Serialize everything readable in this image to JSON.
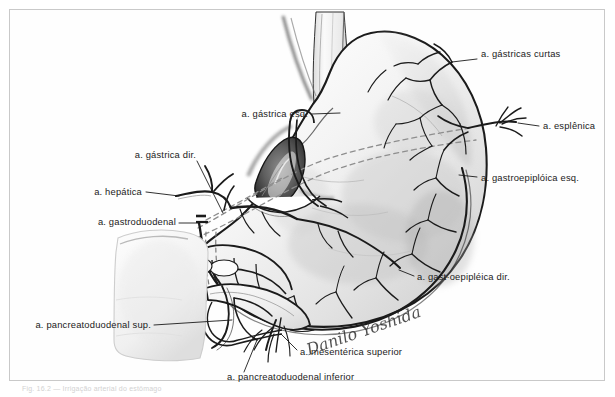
{
  "figure": {
    "title": "Irrigação arterial do estômago",
    "caption": "Fig. 16.2 — Irrigação arterial do estômago",
    "medium": "desenho a lápis e tinta",
    "signature": "Danilo Yoshida",
    "border_color": "#c9c9c9",
    "ink_color": "#1b1b1b",
    "paper_color": "#ffffff"
  },
  "labels": [
    {
      "id": "gastricas-curtas",
      "text": "a. gástricas curtas",
      "align": "left",
      "x": 481,
      "y": 56,
      "leader": [
        [
          477,
          59
        ],
        [
          452,
          62
        ]
      ]
    },
    {
      "id": "esplenica",
      "text": "a. esplênica",
      "align": "left",
      "x": 543,
      "y": 128,
      "leader": [
        [
          539,
          126
        ],
        [
          518,
          123
        ]
      ]
    },
    {
      "id": "gastroepiploica-esq",
      "text": "a. gastroepiplóica esq.",
      "align": "left",
      "x": 481,
      "y": 180,
      "leader": [
        [
          477,
          177
        ],
        [
          459,
          175
        ]
      ]
    },
    {
      "id": "gastroepiploica-dir",
      "text": "a. gast·oepipléica dir.",
      "align": "left",
      "x": 417,
      "y": 279,
      "leader": [
        [
          414,
          276
        ],
        [
          399,
          270
        ]
      ]
    },
    {
      "id": "gastrica-esq",
      "text": "a. gástrica esq.",
      "align": "right",
      "x": 308,
      "y": 116,
      "leader": [
        [
          312,
          114
        ],
        [
          340,
          113
        ]
      ]
    },
    {
      "id": "gastrica-dir",
      "text": "a. gástrica dir.",
      "align": "right",
      "x": 196,
      "y": 157,
      "leader": [
        [
          197,
          161
        ],
        [
          223,
          213
        ]
      ]
    },
    {
      "id": "hepatica",
      "text": "a. hepática",
      "align": "right",
      "x": 142,
      "y": 194,
      "leader": [
        [
          146,
          192
        ],
        [
          179,
          196
        ]
      ]
    },
    {
      "id": "gastroduodenal",
      "text": "a. gastroduodenal",
      "align": "right",
      "x": 176,
      "y": 224,
      "leader": [
        [
          179,
          223
        ],
        [
          199,
          223
        ]
      ]
    },
    {
      "id": "pancreatoduodenal-sup",
      "text": "a. pancreatoduodenal sup.",
      "align": "right",
      "x": 151,
      "y": 327,
      "leader": [
        [
          154,
          325
        ],
        [
          232,
          320
        ]
      ]
    },
    {
      "id": "pancreatoduodenal-inf",
      "text": "a. pancreatoduodenal inferior",
      "align": "left",
      "x": 227,
      "y": 379,
      "leader": [
        [
          244,
          372
        ],
        [
          257,
          340
        ]
      ]
    },
    {
      "id": "mesenterica-superior",
      "text": "a. mesentérica superior",
      "align": "left",
      "x": 300,
      "y": 354,
      "leader": [
        [
          297,
          350
        ],
        [
          281,
          334
        ]
      ]
    }
  ]
}
